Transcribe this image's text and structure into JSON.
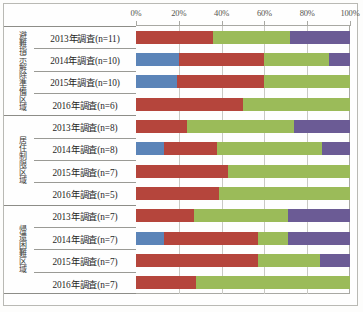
{
  "chart_data": {
    "type": "bar",
    "orientation": "horizontal",
    "stacked": true,
    "normalized_percent": true,
    "title": "",
    "subtitle": "",
    "xlabel": "",
    "ylabel": "",
    "xlim": [
      0,
      100
    ],
    "xtick_labels": [
      "0%",
      "20%",
      "40%",
      "60%",
      "80%",
      "100%"
    ],
    "xticks": [
      0,
      20,
      40,
      60,
      80,
      100
    ],
    "grid": true,
    "legend_position": "none",
    "legend_entries": [],
    "series": [
      {
        "name": "series-1",
        "color": "#5b84b8"
      },
      {
        "name": "series-2",
        "color": "#b5453c"
      },
      {
        "name": "series-3",
        "color": "#9bbb59"
      },
      {
        "name": "series-4",
        "color": "#6b5b95"
      }
    ],
    "groups": [
      {
        "group_label": "避難指示解除準備区域",
        "categories": [
          "2013年調査(n=11)",
          "2014年調査(n=10)",
          "2015年調査(n=10)",
          "2016年調査(n=6)"
        ],
        "values": [
          [
            0,
            36,
            36,
            28
          ],
          [
            20,
            40,
            30,
            10
          ],
          [
            19,
            41,
            40,
            0
          ],
          [
            0,
            50,
            50,
            0
          ]
        ]
      },
      {
        "group_label": "居住制限区域",
        "categories": [
          "2013年調査(n=8)",
          "2014年調査(n=8)",
          "2015年調査(n=7)",
          "2016年調査(n=5)"
        ],
        "values": [
          [
            0,
            24,
            50,
            26
          ],
          [
            13,
            25,
            49,
            13
          ],
          [
            0,
            43,
            57,
            0
          ],
          [
            0,
            39,
            61,
            0
          ]
        ]
      },
      {
        "group_label": "帰還困難区域",
        "categories": [
          "2013年調査(n=7)",
          "2014年調査(n=7)",
          "2015年調査(n=7)",
          "2016年調査(n=7)"
        ],
        "values": [
          [
            0,
            27,
            44,
            29
          ],
          [
            13,
            44,
            14,
            29
          ],
          [
            0,
            57,
            29,
            14
          ],
          [
            0,
            28,
            72,
            0
          ]
        ]
      }
    ]
  }
}
